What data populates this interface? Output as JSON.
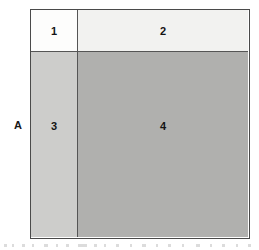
{
  "figure": {
    "name": "four-quadrant-partition-diagram",
    "axis_label": "A",
    "outline_color": "#4a4a4a",
    "divider_color": "#555555",
    "background_color": "#ffffff"
  },
  "chart_data": {
    "type": "heatmap",
    "title": "",
    "subtitle": "",
    "xlabel": "",
    "ylabel": "A",
    "grid": true,
    "legend": "none",
    "rows": 2,
    "columns": 2,
    "categories": [
      "left",
      "right"
    ],
    "row_categories": [
      "top",
      "bottom"
    ],
    "cells": [
      {
        "label": "1",
        "row": 0,
        "column": 0,
        "fill": "#fdfdfc",
        "width_fraction": 0.214,
        "height_fraction": 0.183,
        "area_fraction": 0.039
      },
      {
        "label": "2",
        "row": 0,
        "column": 1,
        "fill": "#f2f2f0",
        "width_fraction": 0.786,
        "height_fraction": 0.183,
        "area_fraction": 0.144
      },
      {
        "label": "3",
        "row": 1,
        "column": 0,
        "fill": "#cdcdcb",
        "width_fraction": 0.214,
        "height_fraction": 0.817,
        "area_fraction": 0.175
      },
      {
        "label": "4",
        "row": 1,
        "column": 1,
        "fill": "#b0b0ae",
        "width_fraction": 0.786,
        "height_fraction": 0.817,
        "area_fraction": 0.642
      }
    ],
    "values": [
      [
        1,
        2
      ],
      [
        3,
        4
      ]
    ],
    "colors": [
      "#fdfdfc",
      "#f2f2f0",
      "#cdcdcb",
      "#b0b0ae"
    ]
  },
  "artifacts": {
    "description": "faint scan marks along bottom edge",
    "marks": [
      {
        "left": 4,
        "width": 3
      },
      {
        "left": 12,
        "width": 2
      },
      {
        "left": 22,
        "width": 3
      },
      {
        "left": 32,
        "width": 2
      },
      {
        "left": 44,
        "width": 4
      },
      {
        "left": 56,
        "width": 2
      },
      {
        "left": 66,
        "width": 3
      },
      {
        "left": 78,
        "width": 9
      },
      {
        "left": 94,
        "width": 3
      },
      {
        "left": 104,
        "width": 2
      },
      {
        "left": 116,
        "width": 3
      },
      {
        "left": 130,
        "width": 2
      },
      {
        "left": 142,
        "width": 4
      },
      {
        "left": 156,
        "width": 2
      },
      {
        "left": 168,
        "width": 3
      },
      {
        "left": 182,
        "width": 2
      },
      {
        "left": 196,
        "width": 4
      },
      {
        "left": 210,
        "width": 2
      },
      {
        "left": 222,
        "width": 3
      },
      {
        "left": 236,
        "width": 2
      },
      {
        "left": 248,
        "width": 3
      }
    ]
  }
}
